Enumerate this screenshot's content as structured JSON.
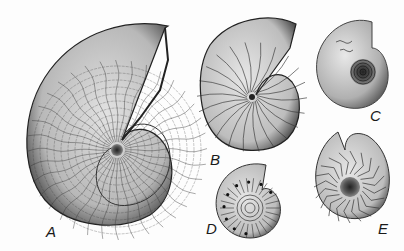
{
  "figure": {
    "specimens": [
      {
        "id": "A",
        "label": "A",
        "ornament": "complex frilled suture lines, large involute shell"
      },
      {
        "id": "B",
        "label": "B",
        "ornament": "sinuous ribs / simple suture lines"
      },
      {
        "id": "C",
        "label": "C",
        "ornament": "smooth shell, small faint sutures near aperture, deep umbilicus"
      },
      {
        "id": "D",
        "label": "D",
        "ornament": "evolute shell with ribs and tubercles"
      },
      {
        "id": "E",
        "label": "E",
        "ornament": "chevron-shaped suture lines, open umbilicus"
      }
    ]
  },
  "colors": {
    "ink": "#1a1a1a",
    "shell_light": "#d8d8d8",
    "shell_mid": "#a8a8a8",
    "shell_dark": "#505050",
    "background": "#fdfdfd"
  }
}
